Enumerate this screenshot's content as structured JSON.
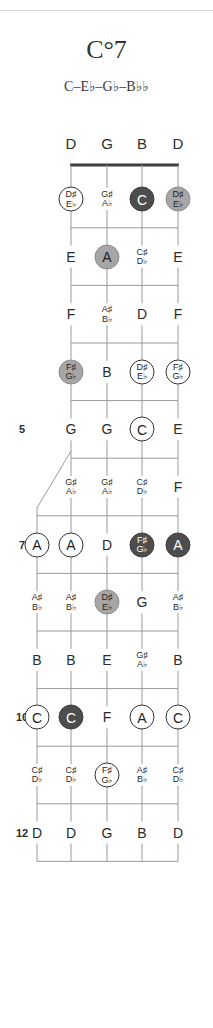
{
  "header": {
    "chord_title": "C°7",
    "chord_notes": "C–E♭–G♭–B♭♭"
  },
  "diagram": {
    "instrument_strings_upper": [
      "D",
      "G",
      "B",
      "D"
    ],
    "fret_markers": [
      "5",
      "7",
      "10",
      "12"
    ],
    "colors": {
      "dark_fill": "#4d4d4d",
      "mid_fill": "#a6a6a6",
      "open_fill": "#ffffff",
      "line": "#9a9a9a",
      "nut": "#3d3d3d",
      "text": "#2b2b2b"
    },
    "string_labels": {
      "s1": "D",
      "s2": "G",
      "s3": "B",
      "s4": "D"
    },
    "frets": [
      {
        "number": "1",
        "marker": "",
        "notes": [
          {
            "text": "D♯\nE♭",
            "style": "open"
          },
          {
            "text": "G♯\nA♭",
            "style": "plain"
          },
          {
            "text": "C",
            "style": "dark"
          },
          {
            "text": "D♯\nE♭",
            "style": "mid"
          }
        ]
      },
      {
        "number": "2",
        "marker": "",
        "notes": [
          {
            "text": "E",
            "style": "plain"
          },
          {
            "text": "A",
            "style": "mid"
          },
          {
            "text": "C♯\nD♭",
            "style": "plain"
          },
          {
            "text": "E",
            "style": "plain"
          }
        ]
      },
      {
        "number": "3",
        "marker": "",
        "notes": [
          {
            "text": "F",
            "style": "plain"
          },
          {
            "text": "A♯\nB♭",
            "style": "plain"
          },
          {
            "text": "D",
            "style": "plain"
          },
          {
            "text": "F",
            "style": "plain"
          }
        ]
      },
      {
        "number": "4",
        "marker": "",
        "notes": [
          {
            "text": "F♯\nG♭",
            "style": "mid"
          },
          {
            "text": "B",
            "style": "plain"
          },
          {
            "text": "D♯\nE♭",
            "style": "open"
          },
          {
            "text": "F♯\nG♭",
            "style": "open"
          }
        ]
      },
      {
        "number": "5",
        "marker": "5",
        "notes": [
          {
            "text": "G",
            "style": "plain"
          },
          {
            "text": "G",
            "style": "plain"
          },
          {
            "text": "C",
            "style": "open"
          },
          {
            "text": "E",
            "style": "plain"
          },
          {
            "text": "G",
            "style": "plain"
          }
        ]
      },
      {
        "number": "6",
        "marker": "",
        "notes": [
          {
            "text": "G♯\nA♭",
            "style": "plain"
          },
          {
            "text": "G♯\nA♭",
            "style": "plain"
          },
          {
            "text": "C♯\nD♭",
            "style": "plain"
          },
          {
            "text": "F",
            "style": "plain"
          },
          {
            "text": "G♯\nA♭",
            "style": "plain"
          }
        ]
      },
      {
        "number": "7",
        "marker": "7",
        "notes": [
          {
            "text": "A",
            "style": "open"
          },
          {
            "text": "A",
            "style": "open"
          },
          {
            "text": "D",
            "style": "plain"
          },
          {
            "text": "F♯\nG♭",
            "style": "dark"
          },
          {
            "text": "A",
            "style": "dark"
          }
        ]
      },
      {
        "number": "8",
        "marker": "",
        "notes": [
          {
            "text": "A♯\nB♭",
            "style": "plain"
          },
          {
            "text": "A♯\nB♭",
            "style": "plain"
          },
          {
            "text": "D♯\nE♭",
            "style": "mid"
          },
          {
            "text": "G",
            "style": "plain"
          },
          {
            "text": "A♯\nB♭",
            "style": "plain"
          }
        ]
      },
      {
        "number": "9",
        "marker": "",
        "notes": [
          {
            "text": "B",
            "style": "plain"
          },
          {
            "text": "B",
            "style": "plain"
          },
          {
            "text": "E",
            "style": "plain"
          },
          {
            "text": "G♯\nA♭",
            "style": "plain"
          },
          {
            "text": "B",
            "style": "plain"
          }
        ]
      },
      {
        "number": "10",
        "marker": "10",
        "notes": [
          {
            "text": "C",
            "style": "open"
          },
          {
            "text": "C",
            "style": "dark"
          },
          {
            "text": "F",
            "style": "plain"
          },
          {
            "text": "A",
            "style": "open"
          },
          {
            "text": "C",
            "style": "open"
          }
        ]
      },
      {
        "number": "11",
        "marker": "",
        "notes": [
          {
            "text": "C♯\nD♭",
            "style": "plain"
          },
          {
            "text": "C♯\nD♭",
            "style": "plain"
          },
          {
            "text": "F♯\nG♭",
            "style": "open"
          },
          {
            "text": "A♯\nB♭",
            "style": "plain"
          },
          {
            "text": "C♯\nD♭",
            "style": "plain"
          }
        ]
      },
      {
        "number": "12",
        "marker": "12",
        "notes": [
          {
            "text": "D",
            "style": "plain"
          },
          {
            "text": "D",
            "style": "plain"
          },
          {
            "text": "G",
            "style": "plain"
          },
          {
            "text": "B",
            "style": "plain"
          },
          {
            "text": "D",
            "style": "plain"
          }
        ]
      }
    ]
  }
}
